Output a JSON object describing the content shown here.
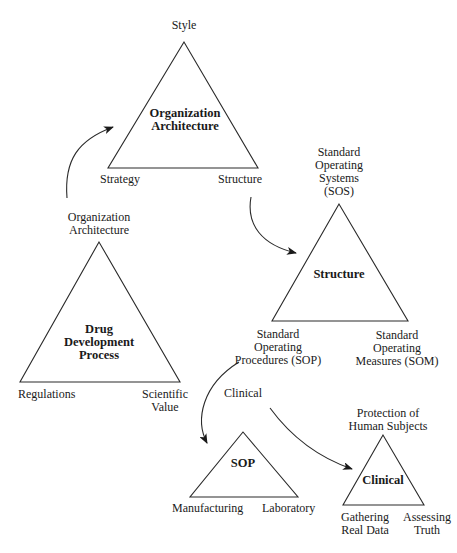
{
  "diagram": {
    "stroke_color": "#2a2a2a",
    "triangles": [
      {
        "id": "organization-architecture",
        "center_lines": [
          "Organization",
          "Architecture"
        ],
        "top": "Style",
        "bottom_left": "Strategy",
        "bottom_right": "Structure"
      },
      {
        "id": "drug-development-process",
        "center_lines": [
          "Drug",
          "Development",
          "Process"
        ],
        "top_lines": [
          "Organization",
          "Architecture"
        ],
        "bottom_left": "Regulations",
        "bottom_right_lines": [
          "Scientific",
          "Value"
        ]
      },
      {
        "id": "structure",
        "center_lines": [
          "Structure"
        ],
        "top_lines": [
          "Standard",
          "Operating",
          "Systems",
          "(SOS)"
        ],
        "bottom_left_lines": [
          "Standard",
          "Operating",
          "Procedures (SOP)"
        ],
        "bottom_right_lines": [
          "Standard",
          "Operating",
          "Measures (SOM)"
        ]
      },
      {
        "id": "sop",
        "center_lines": [
          "SOP"
        ],
        "top": "Clinical",
        "bottom_left": "Manufacturing",
        "bottom_right": "Laboratory"
      },
      {
        "id": "clinical",
        "center_lines": [
          "Clinical"
        ],
        "top_lines": [
          "Protection of",
          "Human Subjects"
        ],
        "bottom_left_lines": [
          "Gathering",
          "Real Data"
        ],
        "bottom_right_lines": [
          "Assessing",
          "Truth"
        ]
      }
    ],
    "arrows": [
      {
        "from": "drug-development-process.top",
        "to": "organization-architecture"
      },
      {
        "from": "organization-architecture.bottom_right",
        "to": "structure"
      },
      {
        "from": "structure.bottom_left",
        "to": "sop"
      },
      {
        "from": "sop.top",
        "to": "clinical"
      }
    ]
  }
}
